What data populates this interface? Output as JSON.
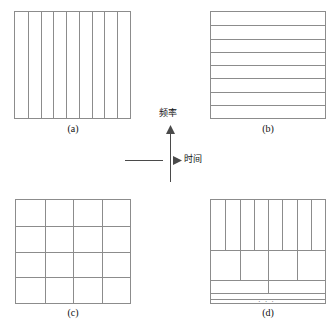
{
  "figure": {
    "title": "",
    "background_color": "#ffffff",
    "line_color": "#8c8c8c",
    "axis_color": "#4a4a4a",
    "text_color": "#111111",
    "width": 334,
    "height": 329
  },
  "axes": {
    "vertical_label": "频率",
    "horizontal_label": "时间",
    "center_x": 170,
    "center_y": 160
  },
  "panels": [
    {
      "id": "a",
      "label": "(a)",
      "tiling": "time-sampling",
      "x": 14,
      "y": 11,
      "width": 117,
      "height": 108,
      "label_x": 53,
      "label_y": 123,
      "columns": 9,
      "rows": 1
    },
    {
      "id": "b",
      "label": "(b)",
      "tiling": "frequency-sampling",
      "x": 210,
      "y": 11,
      "width": 116,
      "height": 108,
      "label_x": 248,
      "label_y": 123,
      "columns": 1,
      "rows": 8
    },
    {
      "id": "c",
      "label": "(c)",
      "tiling": "uniform-stft",
      "x": 15,
      "y": 199,
      "width": 116,
      "height": 105,
      "label_x": 53,
      "label_y": 307,
      "columns": 4,
      "rows": 4
    },
    {
      "id": "d",
      "label": "(d)",
      "tiling": "dyadic-wavelet",
      "x": 210,
      "y": 199,
      "width": 116,
      "height": 105,
      "label_x": 248,
      "label_y": 307,
      "ellipsis": "· · ·",
      "bands": [
        {
          "top": 0,
          "height": 50,
          "divisions": 8
        },
        {
          "top": 50,
          "height": 30,
          "divisions": 4
        },
        {
          "top": 80,
          "height": 13,
          "divisions": 2
        },
        {
          "top": 93,
          "height": 6,
          "divisions": 1
        },
        {
          "top": 99,
          "height": 5,
          "divisions": 1
        }
      ]
    }
  ]
}
